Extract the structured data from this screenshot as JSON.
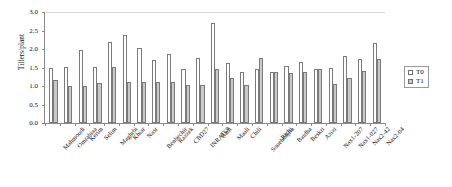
{
  "chart_data": {
    "type": "bar",
    "title": "",
    "xlabel": "",
    "ylabel": "Tillers/plant",
    "ylim": [
      0.0,
      3.0
    ],
    "ytick_step": 0.5,
    "ytick_labels": [
      "0.0",
      "0.5",
      "1.0",
      "1.5",
      "2.0",
      "2.5",
      "3.0"
    ],
    "grid": false,
    "legend_position": "right",
    "categories": [
      "Mahmoudi",
      "Omrabiaa",
      "Kerim",
      "Selim",
      "Maghrbi",
      "Khiar",
      "Nasr",
      "Benbechir",
      "Razzek",
      "CBD27",
      "INRAT69",
      "Badi",
      "Maali",
      "Chili",
      "Souehedjlia",
      "Richi",
      "Baidha",
      "Beskri",
      "Azizi",
      "Nax1-207",
      "Nax1-027",
      "Nax2-42",
      "Nax2-04"
    ],
    "series": [
      {
        "name": "T0",
        "color": "#ffffff",
        "values": [
          1.5,
          1.51,
          1.97,
          1.51,
          2.18,
          2.37,
          2.02,
          1.69,
          1.86,
          1.45,
          1.75,
          2.71,
          1.62,
          1.37,
          1.46,
          1.39,
          1.55,
          1.64,
          1.47,
          1.49,
          1.81,
          1.74,
          2.16
        ]
      },
      {
        "name": "T1",
        "color": "#c9c9c9",
        "values": [
          1.17,
          1.01,
          1.01,
          1.09,
          1.51,
          1.1,
          1.1,
          1.11,
          1.12,
          1.03,
          1.04,
          1.45,
          1.21,
          1.04,
          1.77,
          1.39,
          1.36,
          1.39,
          1.47,
          1.06,
          1.23,
          1.41,
          1.73
        ]
      }
    ]
  },
  "legend": {
    "items": [
      {
        "label": "T0"
      },
      {
        "label": "T1"
      }
    ]
  }
}
